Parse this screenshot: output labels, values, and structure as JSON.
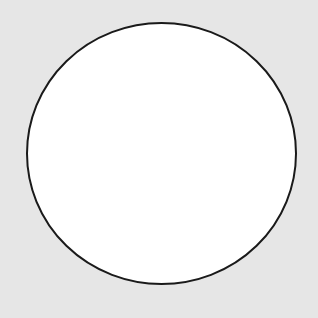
{
  "canvas": {
    "width": 318,
    "height": 318,
    "background": "#e6e6e6"
  },
  "shape": {
    "type": "ellipse",
    "cx": 161.5,
    "cy": 153.5,
    "rx": 134.5,
    "ry": 130.5,
    "fill": "#ffffff",
    "stroke": "#1a1a1a",
    "stroke_width": 2
  }
}
